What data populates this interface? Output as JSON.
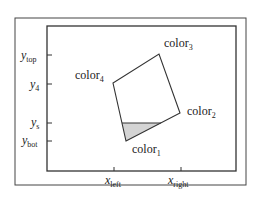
{
  "diagram": {
    "type": "polygon-clipping-illustration",
    "axis_labels": {
      "y_top": {
        "main": "y",
        "sub": "top"
      },
      "y_4": {
        "main": "y",
        "sub": "4"
      },
      "y_s": {
        "main": "y",
        "sub": "s"
      },
      "y_bot": {
        "main": "y",
        "sub": "bot"
      },
      "x_left": {
        "main": "x",
        "sub": "left"
      },
      "x_right": {
        "main": "x",
        "sub": "right"
      }
    },
    "vertices": [
      {
        "main": "color",
        "sub": "1"
      },
      {
        "main": "color",
        "sub": "2"
      },
      {
        "main": "color",
        "sub": "3"
      },
      {
        "main": "color",
        "sub": "4"
      }
    ],
    "colors": {
      "stroke": "#333333",
      "fill_shaded": "#d4d4d4",
      "background": "#ffffff"
    }
  }
}
